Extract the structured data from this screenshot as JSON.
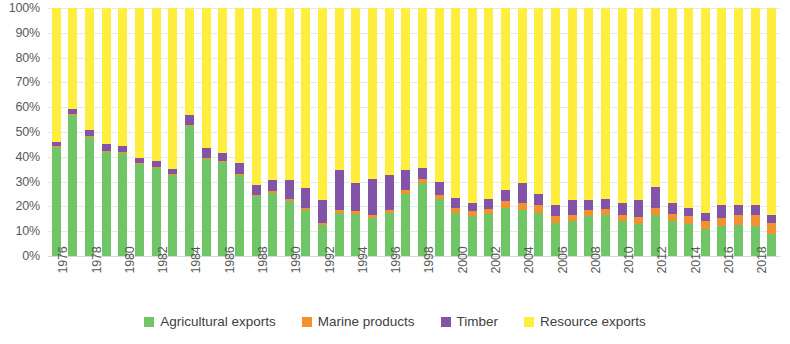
{
  "chart_data": {
    "type": "bar",
    "subtype": "stacked-percentage",
    "title": "",
    "xlabel": "",
    "ylabel": "",
    "ylim": [
      0,
      100
    ],
    "y_unit": "%",
    "grid": true,
    "stacked_total": 100,
    "legend_position": "bottom",
    "categories": [
      "1976",
      "1977",
      "1978",
      "1979",
      "1980",
      "1981",
      "1982",
      "1983",
      "1984",
      "1985",
      "1986",
      "1987",
      "1988",
      "1989",
      "1990",
      "1991",
      "1992",
      "1993",
      "1994",
      "1995",
      "1996",
      "1997",
      "1998",
      "1999",
      "2000",
      "2001",
      "2002",
      "2003",
      "2004",
      "2005",
      "2006",
      "2007",
      "2008",
      "2009",
      "2010",
      "2011",
      "2012",
      "2013",
      "2014",
      "2015",
      "2016",
      "2017",
      "2018",
      "2019"
    ],
    "tick_labels_x": [
      "1976",
      "1978",
      "1980",
      "1982",
      "1984",
      "1986",
      "1988",
      "1990",
      "1992",
      "1994",
      "1996",
      "1998",
      "2000",
      "2002",
      "2004",
      "2006",
      "2008",
      "2010",
      "2012",
      "2014",
      "2016",
      "2018"
    ],
    "tick_labels_y": [
      "0%",
      "10%",
      "20%",
      "30%",
      "40%",
      "50%",
      "60%",
      "70%",
      "80%",
      "90%",
      "100%"
    ],
    "series": [
      {
        "name": "Agricultural exports",
        "color": "#70c667",
        "values": [
          44.0,
          57.0,
          48.0,
          42.0,
          41.5,
          37.0,
          35.5,
          32.5,
          52.5,
          39.0,
          38.0,
          32.5,
          24.0,
          25.5,
          22.0,
          18.5,
          12.5,
          17.5,
          17.0,
          15.5,
          17.5,
          25.0,
          29.5,
          23.0,
          17.5,
          16.0,
          17.0,
          19.5,
          18.5,
          17.5,
          13.5,
          14.0,
          16.0,
          16.5,
          14.0,
          13.0,
          16.5,
          14.0,
          13.0,
          11.0,
          12.0,
          12.5,
          12.0,
          9.0
        ]
      },
      {
        "name": "Marine products",
        "color": "#f2912f",
        "values": [
          0.4,
          0.4,
          0.4,
          0.4,
          0.4,
          0.4,
          0.4,
          0.4,
          0.4,
          0.5,
          0.5,
          0.6,
          0.6,
          0.8,
          0.9,
          1.0,
          1.0,
          1.2,
          1.2,
          1.2,
          1.2,
          1.5,
          1.5,
          1.5,
          1.8,
          2.0,
          2.0,
          2.5,
          3.0,
          3.0,
          2.5,
          2.5,
          2.5,
          2.5,
          2.5,
          2.8,
          3.0,
          3.0,
          3.0,
          3.0,
          3.5,
          4.0,
          4.5,
          4.5
        ]
      },
      {
        "name": "Timber",
        "color": "#8254a8",
        "values": [
          1.6,
          2.0,
          2.6,
          2.6,
          2.6,
          2.1,
          2.6,
          2.1,
          4.1,
          4.0,
          3.0,
          4.4,
          3.9,
          4.2,
          7.6,
          8.0,
          9.0,
          15.8,
          11.3,
          14.3,
          13.8,
          8.0,
          4.5,
          5.5,
          4.2,
          3.5,
          4.0,
          4.5,
          8.0,
          4.5,
          4.5,
          6.0,
          4.0,
          4.0,
          5.0,
          6.7,
          8.5,
          4.5,
          3.5,
          3.5,
          5.0,
          4.0,
          4.0,
          3.0
        ]
      },
      {
        "name": "Resource exports",
        "color": "#ffee3e",
        "values": [
          54.0,
          40.6,
          49.0,
          55.0,
          55.5,
          60.5,
          61.5,
          65.0,
          43.0,
          56.5,
          58.5,
          62.5,
          71.5,
          69.5,
          69.5,
          72.5,
          77.5,
          65.5,
          70.5,
          69.0,
          67.5,
          65.5,
          64.5,
          70.0,
          76.5,
          78.5,
          77.0,
          73.5,
          70.5,
          75.0,
          79.5,
          77.5,
          77.5,
          77.0,
          78.5,
          77.5,
          72.0,
          78.5,
          80.5,
          82.5,
          79.5,
          79.5,
          79.5,
          83.5
        ]
      }
    ]
  },
  "legend": {
    "items": [
      {
        "label": "Agricultural exports",
        "color": "#70c667"
      },
      {
        "label": "Marine products",
        "color": "#f2912f"
      },
      {
        "label": "Timber",
        "color": "#8254a8"
      },
      {
        "label": "Resource exports",
        "color": "#ffee3e"
      }
    ]
  }
}
